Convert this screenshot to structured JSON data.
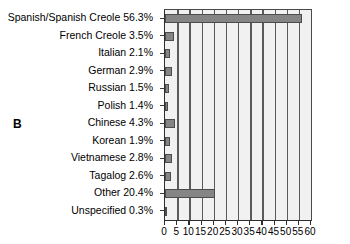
{
  "panel": {
    "letter": "B"
  },
  "chart_data": {
    "type": "bar",
    "orientation": "horizontal",
    "title": "",
    "subtitle": "",
    "xlabel": "",
    "ylabel": "",
    "xlim": [
      0,
      60
    ],
    "ylim": null,
    "grid": true,
    "legend": null,
    "xticks": [
      0,
      5,
      10,
      15,
      20,
      25,
      30,
      35,
      40,
      45,
      50,
      55,
      60
    ],
    "xtick_labels": [
      "0",
      "5",
      "10",
      "15",
      "20",
      "25",
      "30",
      "35",
      "40",
      "45",
      "50",
      "55",
      "60"
    ],
    "categories": [
      "Spanish/Spanish Creole",
      "French Creole",
      "Italian",
      "German",
      "Russian",
      "Polish",
      "Chinese",
      "Korean",
      "Vietnamese",
      "Tagalog",
      "Other",
      "Unspecified"
    ],
    "values": [
      56.3,
      3.5,
      2.1,
      2.9,
      1.5,
      1.4,
      4.3,
      1.9,
      2.8,
      2.6,
      20.4,
      0.3
    ],
    "tick_labels": [
      "Spanish/Spanish Creole 56.3%",
      "French Creole 3.5%",
      "Italian 2.1%",
      "German 2.9%",
      "Russian 1.5%",
      "Polish 1.4%",
      "Chinese 4.3%",
      "Korean 1.9%",
      "Vietnamese 2.8%",
      "Tagalog 2.6%",
      "Other 20.4%",
      "Unspecified 0.3%"
    ],
    "colors": {
      "bar_fill": "#858585",
      "bar_edge": "#4c4c4c",
      "plot_background": "#f1f1f1",
      "gridline": "#5a5a5a",
      "axis": "#2e2e2e",
      "text": "#000000"
    }
  }
}
